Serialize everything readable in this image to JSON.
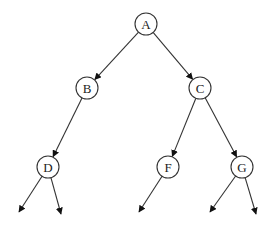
{
  "diagram": {
    "type": "binary-tree",
    "colors": {
      "line": "#333333",
      "node_fill": "#ffffff",
      "text": "#222222",
      "background": "#ffffff"
    },
    "node_radius": 11,
    "nodes": [
      {
        "id": "A",
        "label": "A",
        "x": 146,
        "y": 24
      },
      {
        "id": "B",
        "label": "B",
        "x": 87,
        "y": 88
      },
      {
        "id": "C",
        "label": "C",
        "x": 200,
        "y": 88
      },
      {
        "id": "D",
        "label": "D",
        "x": 48,
        "y": 167
      },
      {
        "id": "F",
        "label": "F",
        "x": 168,
        "y": 167
      },
      {
        "id": "G",
        "label": "G",
        "x": 242,
        "y": 167
      }
    ],
    "edges": [
      {
        "from": "A",
        "to": "B"
      },
      {
        "from": "A",
        "to": "C"
      },
      {
        "from": "B",
        "to": "D"
      },
      {
        "from": "C",
        "to": "F"
      },
      {
        "from": "C",
        "to": "G"
      }
    ],
    "dangling_edges": [
      {
        "from": "D",
        "tip": [
          19,
          212
        ]
      },
      {
        "from": "D",
        "tip": [
          61,
          214
        ]
      },
      {
        "from": "F",
        "tip": [
          139,
          212
        ]
      },
      {
        "from": "G",
        "tip": [
          210,
          212
        ]
      },
      {
        "from": "G",
        "tip": [
          256,
          214
        ]
      }
    ]
  }
}
